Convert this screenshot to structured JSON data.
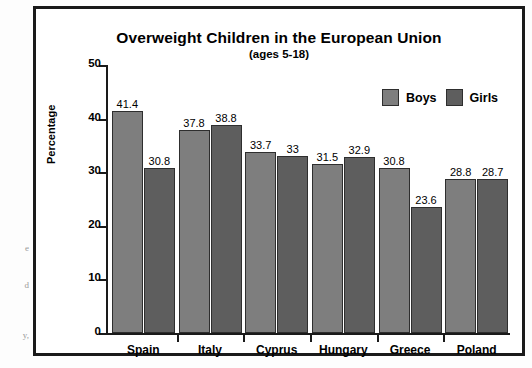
{
  "page_fragments": [
    "e",
    "d",
    "y,"
  ],
  "chart_data": {
    "type": "bar",
    "title": "Overweight Children in the European Union",
    "subtitle": "(ages 5-18)",
    "xlabel": "",
    "ylabel": "Percentage",
    "ylim": [
      0,
      50
    ],
    "yticks": [
      0,
      10,
      20,
      30,
      40,
      50
    ],
    "ytick_labels": [
      "0",
      "10",
      "20",
      "30",
      "40",
      "50"
    ],
    "grid": false,
    "legend_position": "top-right",
    "categories": [
      "Spain",
      "Italy",
      "Cyprus",
      "Hungary",
      "Greece",
      "Poland"
    ],
    "series": [
      {
        "name": "Boys",
        "color": "#7e7e7e",
        "values": [
          41.4,
          37.8,
          33.7,
          31.5,
          30.8,
          28.8
        ],
        "labels": [
          "41.4",
          "37.8",
          "33.7",
          "31.5",
          "30.8",
          "28.8"
        ]
      },
      {
        "name": "Girls",
        "color": "#5e5e5e",
        "values": [
          30.8,
          38.8,
          33,
          32.9,
          23.6,
          28.7
        ],
        "labels": [
          "30.8",
          "38.8",
          "33",
          "32.9",
          "23.6",
          "28.7"
        ]
      }
    ]
  }
}
